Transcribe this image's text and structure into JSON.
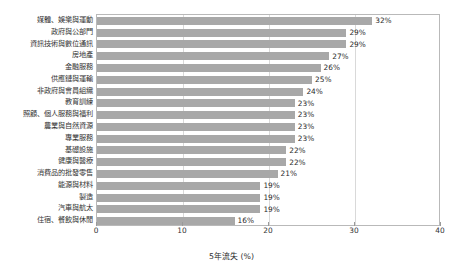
{
  "chart_data": {
    "type": "bar",
    "orientation": "horizontal",
    "title": "",
    "xlabel": "5年流失 (%)",
    "ylabel": "",
    "xlim": [
      0,
      40
    ],
    "xticks": [
      "0",
      "10",
      "20",
      "30",
      "40"
    ],
    "grid": "vertical",
    "legend": "none",
    "bar_color": "#a8a8a8",
    "categories": [
      "媒體、娛樂與運動",
      "政府與公部門",
      "資訊技術與數位通訊",
      "房地產",
      "金融服務",
      "供應鏈與運輸",
      "非政府與會員組織",
      "教育訓練",
      "照顧、個人服務與福利",
      "農業與自然資源",
      "專業服務",
      "基礎設施",
      "健康與醫療",
      "消費品的批發零售",
      "能源與材料",
      "製造",
      "汽車與航太",
      "住宿、餐飲與休閒"
    ],
    "values": [
      32,
      29,
      29,
      27,
      26,
      25,
      24,
      23,
      23,
      23,
      23,
      22,
      22,
      21,
      19,
      19,
      19,
      16
    ],
    "value_labels": [
      "32%",
      "29%",
      "29%",
      "27%",
      "26%",
      "25%",
      "24%",
      "23%",
      "23%",
      "23%",
      "23%",
      "22%",
      "22%",
      "21%",
      "19%",
      "19%",
      "19%",
      "16%"
    ]
  }
}
